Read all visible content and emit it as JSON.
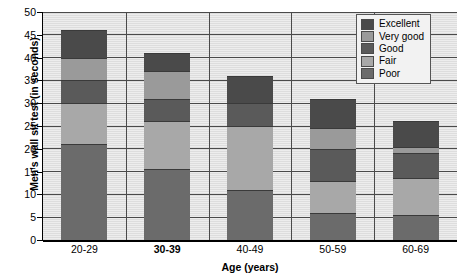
{
  "chart_data": {
    "type": "bar",
    "subtype": "stacked-bar",
    "title": "",
    "xlabel": "Age (years)",
    "ylabel": "Men's wall sit test (in seconds)",
    "categories": [
      "20-29",
      "30-39",
      "40-49",
      "50-59",
      "60-69"
    ],
    "highlighted_category": "30-39",
    "ylim": [
      0,
      50
    ],
    "yticks": [
      0,
      5,
      10,
      15,
      20,
      25,
      30,
      35,
      40,
      45,
      50
    ],
    "grid": true,
    "legend_position": "top-right",
    "legend_entries": [
      "Excellent",
      "Very good",
      "Good",
      "Fair",
      "Poor"
    ],
    "series": [
      {
        "name": "Poor",
        "color": "#6b6b6b",
        "values": [
          21.0,
          15.5,
          11.0,
          6.0,
          5.5
        ]
      },
      {
        "name": "Fair",
        "color": "#a8a8a8",
        "values": [
          9.0,
          10.5,
          14.0,
          7.0,
          8.0
        ]
      },
      {
        "name": "Good",
        "color": "#5a5a5a",
        "values": [
          5.0,
          5.0,
          5.0,
          7.0,
          5.5
        ]
      },
      {
        "name": "Very good",
        "color": "#9a9a9a",
        "values": [
          5.0,
          6.0,
          0.0,
          4.5,
          1.5
        ]
      },
      {
        "name": "Excellent",
        "color": "#4a4a4a",
        "values": [
          6.0,
          4.0,
          6.0,
          6.5,
          5.5
        ]
      }
    ],
    "bar_totals": [
      46.0,
      41.0,
      36.0,
      31.5,
      26.0
    ],
    "segment_boundaries": {
      "20-29": [
        0,
        21,
        30,
        35,
        40,
        46
      ],
      "30-39": [
        0,
        15.5,
        26,
        31,
        37,
        41
      ],
      "40-49": [
        0,
        11,
        25,
        30,
        30,
        36
      ],
      "50-59": [
        0,
        6,
        13,
        20,
        24.5,
        31.5
      ],
      "60-69": [
        0,
        5.5,
        13.5,
        19,
        20.5,
        26
      ]
    }
  },
  "colors": {
    "panel_background": "#e9e9e9",
    "grid": "#4a4a4a",
    "axis": "#000000",
    "legend_background": "#f2f2f2",
    "legend_border": "#555555",
    "excellent": "#4a4a4a",
    "very_good": "#9a9a9a",
    "good": "#5a5a5a",
    "fair": "#a8a8a8",
    "poor": "#6b6b6b"
  },
  "legend": {
    "items": [
      {
        "label": "Excellent",
        "color": "#4a4a4a"
      },
      {
        "label": "Very good",
        "color": "#9a9a9a"
      },
      {
        "label": "Good",
        "color": "#5a5a5a"
      },
      {
        "label": "Fair",
        "color": "#a8a8a8"
      },
      {
        "label": "Poor",
        "color": "#6b6b6b"
      }
    ]
  },
  "axes": {
    "y_title": "Men's wall sit test (in seconds)",
    "x_title": "Age (years)",
    "y_tick_labels": [
      "0",
      "5",
      "10",
      "15",
      "20",
      "25",
      "30",
      "35",
      "40",
      "45",
      "50"
    ],
    "x_tick_labels": [
      "20-29",
      "30-39",
      "40-49",
      "50-59",
      "60-69"
    ]
  }
}
